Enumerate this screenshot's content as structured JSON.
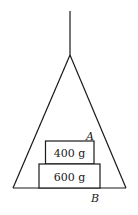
{
  "diagram": {
    "string": {
      "x": 70,
      "y_top": 11,
      "y_bottom": 55
    },
    "triangle": {
      "apex": [
        70,
        55
      ],
      "base_left": [
        13,
        188
      ],
      "base_right": [
        126,
        188
      ]
    },
    "blocks": [
      {
        "label": "400 g",
        "x": 45,
        "y": 141,
        "width": 49,
        "height": 23
      },
      {
        "label": "600 g",
        "x": 39,
        "y": 164,
        "width": 61,
        "height": 24
      }
    ],
    "points": [
      {
        "label": "A",
        "x": 87,
        "y": 140
      },
      {
        "label": "B",
        "x": 91,
        "y": 203
      }
    ],
    "stroke_color": "#1a1a1a"
  }
}
